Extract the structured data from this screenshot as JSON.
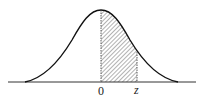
{
  "diagram": {
    "type": "normal-distribution-curve",
    "shaded_region": {
      "from": "0",
      "to": "z",
      "fill": "diagonal-hatch"
    },
    "labels": {
      "origin": "0",
      "z": "z"
    },
    "colors": {
      "curve": "#111111",
      "hatch": "#444444",
      "axis": "#333333"
    }
  }
}
